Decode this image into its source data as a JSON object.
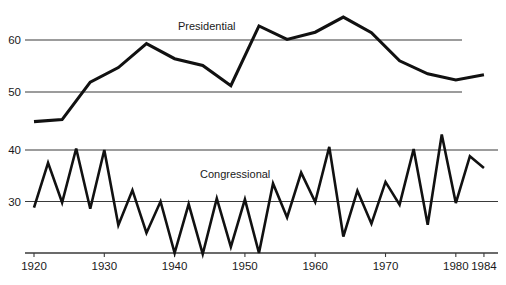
{
  "chart_data": {
    "type": "line",
    "title": "",
    "subtitle": "",
    "xlabel": "",
    "ylabel": "",
    "grid": true,
    "legend_position": "inline-annotation",
    "panels": [
      {
        "name": "Presidential",
        "annotation": "Presidential",
        "ylim": [
          44,
          66
        ],
        "yticks": [
          50,
          60
        ],
        "ytick_labels": [
          "50",
          "60"
        ],
        "gridlines": [
          50,
          60
        ]
      },
      {
        "name": "Congressional",
        "annotation": "Congressional",
        "ylim": [
          20,
          44
        ],
        "yticks": [
          30,
          40
        ],
        "ytick_labels": [
          "30",
          "40"
        ],
        "gridlines": [
          20,
          30,
          40
        ]
      }
    ],
    "xlim": [
      1920,
      1986
    ],
    "xticks": [
      1920,
      1930,
      1940,
      1950,
      1960,
      1970,
      1980,
      1984
    ],
    "xtick_labels": [
      "1920",
      "1930",
      "1940",
      "1950",
      "1960",
      "1970",
      "1980",
      "1984"
    ],
    "series": [
      {
        "name": "Presidential",
        "panel": 0,
        "x": [
          1920,
          1924,
          1928,
          1932,
          1936,
          1940,
          1944,
          1948,
          1952,
          1956,
          1960,
          1964,
          1968,
          1972,
          1976,
          1980,
          1984
        ],
        "values": [
          44.3,
          44.7,
          51.9,
          54.7,
          59.3,
          56.4,
          55.1,
          51.2,
          62.7,
          60.1,
          61.5,
          64.4,
          61.4,
          56.0,
          53.5,
          52.3,
          53.3
        ]
      },
      {
        "name": "Congressional",
        "panel": 1,
        "x": [
          1920,
          1922,
          1924,
          1926,
          1928,
          1930,
          1932,
          1934,
          1936,
          1938,
          1940,
          1942,
          1944,
          1946,
          1948,
          1950,
          1952,
          1954,
          1956,
          1958,
          1960,
          1962,
          1964,
          1966,
          1968,
          1970,
          1972,
          1974,
          1976,
          1978,
          1980,
          1982,
          1984
        ],
        "values": [
          28.8,
          37.5,
          29.8,
          40.3,
          28.6,
          40.0,
          25.4,
          32.2,
          23.9,
          30.0,
          20.0,
          29.5,
          19.8,
          30.6,
          21.2,
          30.4,
          20.0,
          33.5,
          26.9,
          35.6,
          29.9,
          40.6,
          23.2,
          32.1,
          25.7,
          33.8,
          29.4,
          40.2,
          25.5,
          43.0,
          29.7,
          38.8,
          36.5
        ]
      }
    ]
  }
}
